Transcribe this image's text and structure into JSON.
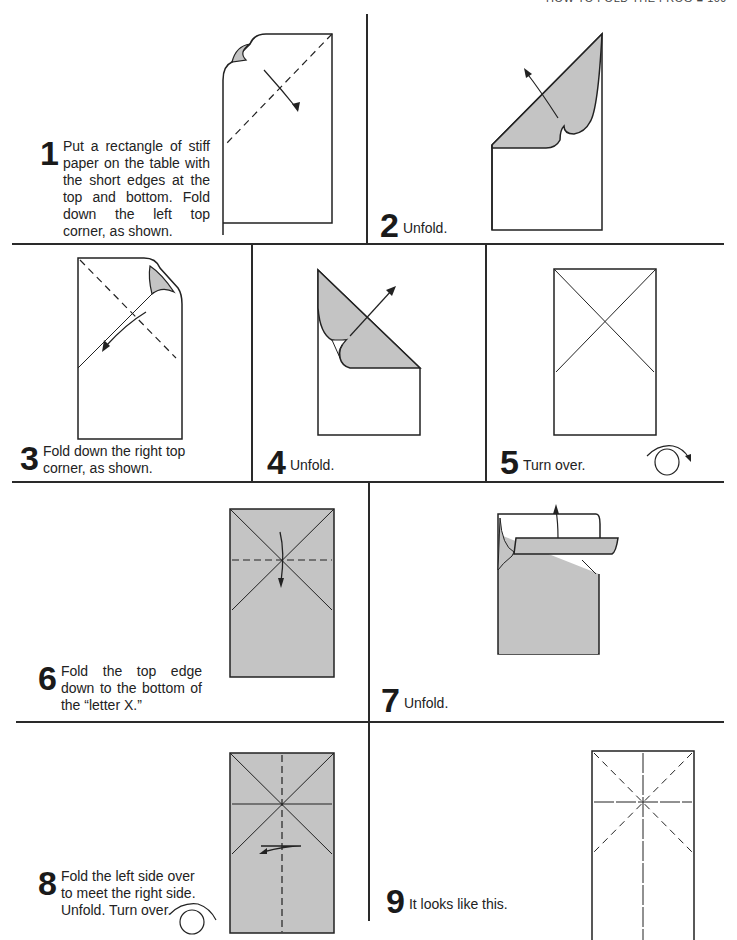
{
  "header": {
    "text": "HOW TO FOLD THE FROG  ■  109"
  },
  "steps": [
    {
      "number": "1",
      "text": "Put a rectangle of stiff paper on the table with the short edges at the top and bottom. Fold down the left top corner, as shown."
    },
    {
      "number": "2",
      "text": "Unfold."
    },
    {
      "number": "3",
      "text": "Fold down the right top corner, as shown."
    },
    {
      "number": "4",
      "text": "Unfold."
    },
    {
      "number": "5",
      "text": "Turn over."
    },
    {
      "number": "6",
      "text": "Fold the top edge down to the bottom of the “letter X.”"
    },
    {
      "number": "7",
      "text": "Unfold."
    },
    {
      "number": "8",
      "text": "Fold the left side over to meet the right side. Unfold. Turn over."
    },
    {
      "number": "9",
      "text": "It looks like this."
    }
  ],
  "colors": {
    "paper_shade": "#c4c4c4",
    "line": "#2a2a2a",
    "background": "#ffffff"
  }
}
